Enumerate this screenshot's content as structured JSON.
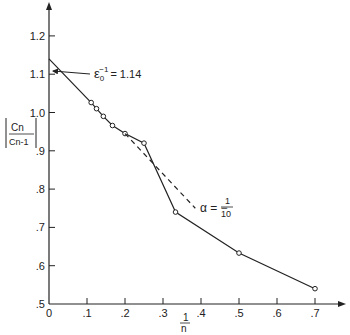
{
  "chart_data": {
    "type": "line",
    "title": "",
    "xlabel": "1/n",
    "ylabel": "|Cn / Cn-1|",
    "xlim": [
      0,
      0.75
    ],
    "ylim": [
      0.5,
      1.25
    ],
    "grid": false,
    "x_ticks": [
      "0",
      ".1",
      ".2",
      ".3",
      ".4",
      ".5",
      ".6",
      ".7"
    ],
    "y_ticks": [
      ".5",
      ".6",
      ".7",
      ".8",
      ".9",
      "1.0",
      "1.1",
      "1.2"
    ],
    "series": [
      {
        "name": "data",
        "style": "solid-with-circles",
        "x": [
          0.0,
          0.111,
          0.125,
          0.143,
          0.167,
          0.2,
          0.25,
          0.333,
          0.5,
          0.7
        ],
        "y": [
          1.14,
          1.026,
          1.01,
          0.99,
          0.966,
          0.945,
          0.92,
          0.74,
          0.633,
          0.54
        ]
      },
      {
        "name": "alpha = -1/10",
        "style": "dashed",
        "x": [
          0.2,
          0.385
        ],
        "y": [
          0.945,
          0.75
        ]
      }
    ],
    "annotations": [
      {
        "text": "ε0⁻¹ = 1.14",
        "x": 0,
        "y": 1.14,
        "arrow": true
      },
      {
        "text": "α = - 1/10",
        "x": 0.39,
        "y": 0.755
      }
    ]
  },
  "labels": {
    "eps_label": "ε",
    "eps_sub": "0",
    "eps_sup": "−1",
    "eps_value": "= 1.14",
    "alpha_label": "α = −",
    "alpha_num": "1",
    "alpha_den": "10",
    "y_num": "Cn",
    "y_den": "Cn-1",
    "x_num": "1",
    "x_den": "n"
  }
}
